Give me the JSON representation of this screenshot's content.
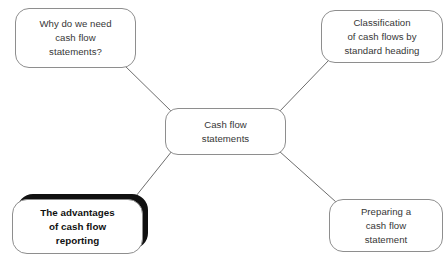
{
  "diagram": {
    "type": "mind-map",
    "background_color": "#ffffff",
    "node_border_color": "#8e8e8e",
    "node_fill_color": "#ffffff",
    "connector_color": "#6d6d6d",
    "highlight_border_color": "#111111",
    "text_color": "#363636",
    "center": {
      "id": "center",
      "label": "Cash flow\nstatements",
      "highlighted": false
    },
    "branches": [
      {
        "id": "why",
        "position": "top-left",
        "label": "Why do we need\ncash flow\nstatements?",
        "highlighted": false
      },
      {
        "id": "classification",
        "position": "top-right",
        "label": "Classification\nof cash flows by\nstandard heading",
        "highlighted": false
      },
      {
        "id": "advantages",
        "position": "bottom-left",
        "label": "The advantages\nof cash flow\nreporting",
        "highlighted": true
      },
      {
        "id": "preparing",
        "position": "bottom-right",
        "label": "Preparing a\ncash flow\nstatement",
        "highlighted": false
      }
    ],
    "connectors": [
      {
        "id": "center-to-why",
        "from": "center",
        "to": "why"
      },
      {
        "id": "center-to-classification",
        "from": "center",
        "to": "classification"
      },
      {
        "id": "center-to-advantages",
        "from": "center",
        "to": "advantages"
      },
      {
        "id": "center-to-preparing",
        "from": "center",
        "to": "preparing"
      }
    ]
  }
}
